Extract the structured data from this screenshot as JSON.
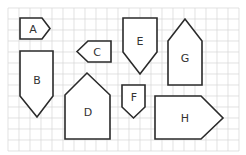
{
  "diagram": {
    "type": "shapes-on-grid",
    "grid": {
      "columns": 21,
      "rows": 13,
      "color": "#d6d6d6"
    },
    "stroke_color": "#2a2a2a",
    "shapes": [
      {
        "id": "A",
        "label": "A",
        "kind": "pentagon-pointing-right"
      },
      {
        "id": "B",
        "label": "B",
        "kind": "pentagon-pointing-down"
      },
      {
        "id": "C",
        "label": "C",
        "kind": "pentagon-pointing-left"
      },
      {
        "id": "D",
        "label": "D",
        "kind": "pentagon-pointing-up"
      },
      {
        "id": "E",
        "label": "E",
        "kind": "pentagon-pointing-down"
      },
      {
        "id": "F",
        "label": "F",
        "kind": "pentagon-pointing-down"
      },
      {
        "id": "G",
        "label": "G",
        "kind": "pentagon-pointing-up"
      },
      {
        "id": "H",
        "label": "H",
        "kind": "pentagon-pointing-right"
      }
    ]
  }
}
